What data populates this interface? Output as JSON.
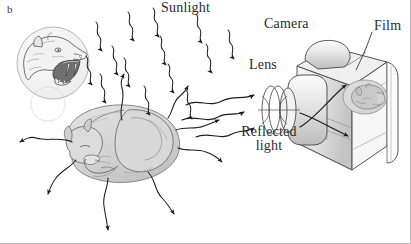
{
  "figure": {
    "panel_label": "b",
    "background_color": "#ffffff",
    "ink_color": "#2b2b2b",
    "fill_gray": "#d6d6d6"
  },
  "labels": {
    "sunlight": "Sunlight",
    "camera": "Camera",
    "film": "Film",
    "lens": "Lens",
    "reflected_line1": "Reflected",
    "reflected_line2": "light"
  },
  "icons": {
    "sunlight_ray": "wavy-arrow-icon",
    "reflected_ray": "wavy-arrow-icon",
    "scatter_ray": "wavy-arrow-icon",
    "cat": "sleeping-cat-icon",
    "roaring_cat_inset": "roaring-big-cat-head-icon",
    "camera_body": "camera-body-icon",
    "lens": "lens-icon",
    "film_plane": "film-plane-icon",
    "inverted_image": "inverted-cat-image-icon"
  },
  "counts": {
    "sunlight_rays": 14,
    "reflected_rays": 3,
    "scattered_rays": 6
  }
}
